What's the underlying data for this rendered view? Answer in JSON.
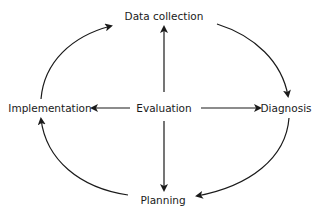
{
  "diagram": {
    "type": "cycle",
    "center": {
      "label": "Evaluation"
    },
    "nodes": [
      {
        "id": "data_collection",
        "label": "Data collection"
      },
      {
        "id": "diagnosis",
        "label": "Diagnosis"
      },
      {
        "id": "planning",
        "label": "Planning"
      },
      {
        "id": "implementation",
        "label": "Implementation"
      }
    ],
    "cycle_edges": [
      {
        "from": "Data collection",
        "to": "Diagnosis"
      },
      {
        "from": "Diagnosis",
        "to": "Planning"
      },
      {
        "from": "Planning",
        "to": "Implementation"
      },
      {
        "from": "Implementation",
        "to": "Data collection"
      }
    ],
    "center_edges": [
      {
        "from": "Evaluation",
        "to": "Data collection"
      },
      {
        "from": "Evaluation",
        "to": "Diagnosis"
      },
      {
        "from": "Evaluation",
        "to": "Planning"
      },
      {
        "from": "Evaluation",
        "to": "Implementation"
      }
    ],
    "colors": {
      "stroke": "#1a1a1a",
      "background": "#ffffff"
    }
  }
}
